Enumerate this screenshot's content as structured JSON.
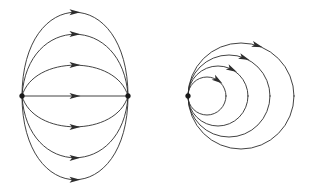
{
  "figure": {
    "background_color": "#ffffff",
    "stroke_color": "#2e2e2e",
    "node_color": "#1a1a1a",
    "stroke_width": 0.9,
    "width": 311,
    "height": 192
  },
  "chart_data": {
    "type": "diagram",
    "panels": [
      {
        "name": "dipole-panel",
        "label": "Source-sink dipole field lines",
        "nodes": [
          {
            "name": "source-node",
            "x": 22,
            "y": 96,
            "role": "source",
            "radius": 2.4
          },
          {
            "name": "sink-node",
            "x": 128,
            "y": 96,
            "role": "sink",
            "radius": 2.4
          }
        ],
        "curves": [
          {
            "name": "arc-upper-3",
            "bulge": -84,
            "direction": "left-to-right",
            "arrow_at": 0.5
          },
          {
            "name": "arc-upper-2",
            "bulge": -62,
            "direction": "left-to-right",
            "arrow_at": 0.5
          },
          {
            "name": "arc-upper-1",
            "bulge": -31,
            "direction": "left-to-right",
            "arrow_at": 0.5
          },
          {
            "name": "arc-straight",
            "bulge": 0,
            "direction": "left-to-right",
            "arrow_at": 0.5
          },
          {
            "name": "arc-lower-1",
            "bulge": 31,
            "direction": "left-to-right",
            "arrow_at": 0.5
          },
          {
            "name": "arc-lower-2",
            "bulge": 62,
            "direction": "left-to-right",
            "arrow_at": 0.5
          },
          {
            "name": "arc-lower-3",
            "bulge": 84,
            "direction": "left-to-right",
            "arrow_at": 0.5
          }
        ],
        "curve_count": 7,
        "arrow_count": 7
      },
      {
        "name": "tangent-circles-panel",
        "label": "Nested circles tangent at a common point",
        "nodes": [
          {
            "name": "tangent-node",
            "x": 188,
            "y": 96,
            "role": "source",
            "radius": 2.4
          }
        ],
        "circles": [
          {
            "name": "circle-1",
            "radius": 19,
            "center_x": 207,
            "center_y": 96,
            "arrow_angle_deg": -55
          },
          {
            "name": "circle-2",
            "radius": 30,
            "center_x": 218,
            "center_y": 96,
            "arrow_angle_deg": -62
          },
          {
            "name": "circle-3",
            "radius": 41,
            "center_x": 229,
            "center_y": 96,
            "arrow_angle_deg": -68
          },
          {
            "name": "circle-4",
            "radius": 53,
            "center_x": 241,
            "center_y": 96,
            "arrow_angle_deg": -72
          }
        ],
        "circle_count": 4,
        "arrow_count": 4,
        "flow_direction": "clockwise"
      }
    ]
  }
}
